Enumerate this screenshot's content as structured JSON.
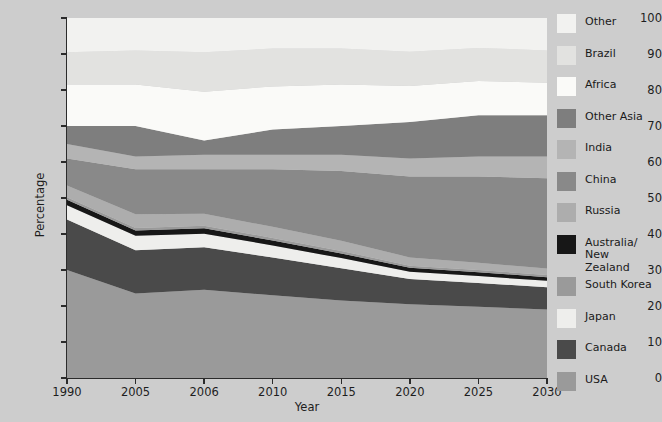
{
  "axes": {
    "y_title": "Percentage",
    "x_title": "Year",
    "y_ticks": [
      "0",
      "10",
      "20",
      "30",
      "40",
      "50",
      "60",
      "70",
      "80",
      "90",
      "100"
    ],
    "x_ticks": [
      "1990",
      "2005",
      "2006",
      "2010",
      "2015",
      "2020",
      "2025",
      "2030"
    ]
  },
  "legend": {
    "items": [
      {
        "label": "Other",
        "color": "#f2f2f0"
      },
      {
        "label": "Brazil",
        "color": "#e2e2e0"
      },
      {
        "label": "Africa",
        "color": "#fafaf8"
      },
      {
        "label": "Other Asia",
        "color": "#7e7e7e"
      },
      {
        "label": "India",
        "color": "#b4b4b4"
      },
      {
        "label": "China",
        "color": "#898989"
      },
      {
        "label": "Russia",
        "color": "#adadad"
      },
      {
        "label": "Australia/\nNew Zealand",
        "color": "#171717"
      },
      {
        "label": "South Korea",
        "color": "#9a9a9a"
      },
      {
        "label": "Japan",
        "color": "#eeeeec"
      },
      {
        "label": "Canada",
        "color": "#4a4a4a"
      },
      {
        "label": "USA",
        "color": "#9a9a9a"
      }
    ]
  },
  "chart_data": {
    "type": "area",
    "title": "",
    "xlabel": "Year",
    "ylabel": "Percentage",
    "ylim": [
      0,
      100
    ],
    "grid": false,
    "stacked": true,
    "legend_position": "right",
    "categories": [
      "1990",
      "2005",
      "2006",
      "2010",
      "2015",
      "2020",
      "2025",
      "2030"
    ],
    "series": [
      {
        "name": "USA",
        "color": "#9a9a9a",
        "values": [
          30.0,
          23.5,
          24.5,
          23.0,
          21.5,
          20.5,
          19.8,
          19.0
        ]
      },
      {
        "name": "Canada",
        "color": "#4a4a4a",
        "values": [
          14.0,
          12.0,
          11.8,
          10.5,
          9.0,
          7.0,
          6.6,
          6.2
        ]
      },
      {
        "name": "Japan",
        "color": "#eeeeec",
        "values": [
          4.0,
          4.0,
          3.8,
          3.3,
          2.8,
          2.0,
          1.9,
          1.8
        ]
      },
      {
        "name": "Australia/New Zealand",
        "color": "#171717",
        "values": [
          1.5,
          1.5,
          1.5,
          1.4,
          1.3,
          1.1,
          1.1,
          1.0
        ]
      },
      {
        "name": "South Korea",
        "color": "#9a9a9a",
        "values": [
          0.7,
          0.7,
          0.7,
          0.7,
          0.7,
          0.6,
          0.6,
          0.6
        ]
      },
      {
        "name": "Russia",
        "color": "#adadad",
        "values": [
          3.3,
          3.8,
          3.3,
          3.1,
          2.8,
          2.3,
          2.0,
          1.8
        ]
      },
      {
        "name": "China",
        "color": "#898989",
        "values": [
          7.5,
          12.5,
          12.4,
          16.0,
          19.4,
          22.5,
          24.0,
          25.1
        ]
      },
      {
        "name": "India",
        "color": "#b4b4b4",
        "values": [
          4.0,
          3.5,
          4.0,
          4.0,
          4.5,
          5.0,
          5.5,
          6.0
        ]
      },
      {
        "name": "Other Asia",
        "color": "#7e7e7e",
        "values": [
          5.0,
          8.5,
          4.0,
          7.0,
          8.0,
          10.1,
          11.5,
          11.5
        ]
      },
      {
        "name": "Africa",
        "color": "#fafaf8",
        "values": [
          11.5,
          11.5,
          13.5,
          12.0,
          11.5,
          10.0,
          9.5,
          9.0
        ]
      },
      {
        "name": "Brazil",
        "color": "#e2e2e0",
        "values": [
          9.0,
          9.5,
          11.0,
          10.5,
          10.0,
          9.5,
          9.2,
          9.0
        ]
      },
      {
        "name": "Other",
        "color": "#f2f2f0",
        "values": [
          9.5,
          9.0,
          9.5,
          8.5,
          8.5,
          9.4,
          8.3,
          9.0
        ]
      }
    ],
    "cumulative_tops": {
      "USA": [
        30.0,
        23.5,
        24.5,
        23.0,
        21.5,
        20.5,
        19.8,
        19.0
      ],
      "Canada": [
        44.0,
        35.5,
        36.3,
        33.5,
        30.5,
        27.5,
        26.4,
        25.2
      ],
      "Japan": [
        48.0,
        39.5,
        40.1,
        36.8,
        33.3,
        29.5,
        28.3,
        27.0
      ],
      "Australia/New Zealand": [
        49.5,
        41.0,
        41.6,
        38.2,
        34.6,
        30.6,
        29.4,
        28.0
      ],
      "South Korea": [
        50.2,
        41.7,
        42.3,
        38.9,
        35.3,
        31.2,
        30.0,
        28.6
      ],
      "Russia": [
        53.5,
        45.5,
        45.6,
        42.0,
        38.1,
        33.5,
        32.0,
        30.4
      ],
      "China": [
        61.0,
        58.0,
        58.0,
        58.0,
        57.5,
        56.0,
        56.0,
        55.5
      ],
      "India": [
        65.0,
        61.5,
        62.0,
        62.0,
        62.0,
        61.0,
        61.5,
        61.5
      ],
      "Other Asia": [
        70.0,
        70.0,
        66.0,
        69.0,
        70.0,
        71.1,
        73.0,
        73.0
      ],
      "Africa": [
        81.5,
        81.5,
        79.5,
        81.0,
        81.5,
        81.1,
        82.5,
        82.0
      ],
      "Brazil": [
        90.5,
        91.0,
        90.5,
        91.5,
        91.5,
        90.6,
        91.7,
        91.0
      ],
      "Other": [
        100.0,
        100.0,
        100.0,
        100.0,
        100.0,
        100.0,
        100.0,
        100.0
      ]
    }
  }
}
